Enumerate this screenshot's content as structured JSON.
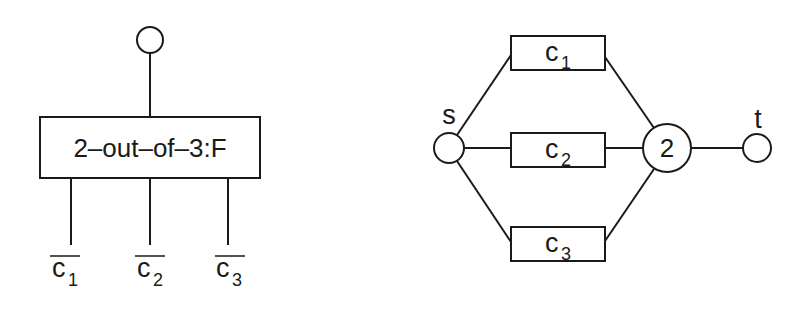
{
  "left_diagram": {
    "title": "fault tree gate",
    "gate_label": "2–out–of–3:F",
    "top_node": "output event circle",
    "inputs": [
      {
        "base": "c",
        "sub": "1",
        "negated": true
      },
      {
        "base": "c",
        "sub": "2",
        "negated": true
      },
      {
        "base": "c",
        "sub": "3",
        "negated": true
      }
    ]
  },
  "right_diagram": {
    "title": "reliability network",
    "source_label": "s",
    "sink_label": "t",
    "kofn_node_label": "2",
    "components": [
      {
        "base": "c",
        "sub": "1"
      },
      {
        "base": "c",
        "sub": "2"
      },
      {
        "base": "c",
        "sub": "3"
      }
    ]
  },
  "colors": {
    "stroke": "#1a1a1a",
    "background": "#ffffff"
  }
}
